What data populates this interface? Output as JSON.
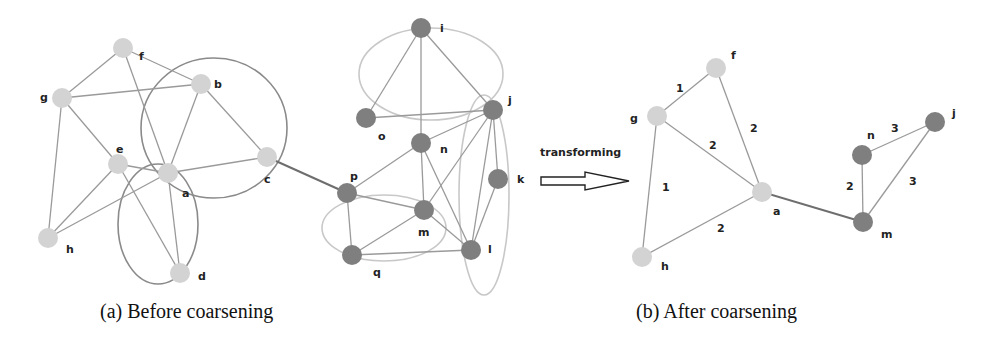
{
  "figure": {
    "arrow_label": "transforming",
    "caption_a": "(a)  Before coarsening",
    "caption_b": "(b) After coarsening"
  },
  "colors": {
    "light_node": "#d3d3d3",
    "dark_node": "#7f7f7f",
    "edge": "#9a9a9a",
    "ellipse_dark": "#8a8a8a",
    "ellipse_light": "#c8c8c8"
  },
  "graph_before": {
    "nodes": [
      {
        "id": "f",
        "x": 123,
        "y": 48,
        "shade": "light",
        "lx": 139,
        "ly": 60
      },
      {
        "id": "b",
        "x": 201,
        "y": 84,
        "shade": "light",
        "lx": 214,
        "ly": 88
      },
      {
        "id": "g",
        "x": 62,
        "y": 98,
        "shade": "light",
        "lx": 40,
        "ly": 101
      },
      {
        "id": "e",
        "x": 118,
        "y": 164,
        "shade": "light",
        "lx": 116,
        "ly": 153
      },
      {
        "id": "a",
        "x": 168,
        "y": 173,
        "shade": "light",
        "lx": 182,
        "ly": 197
      },
      {
        "id": "c",
        "x": 267,
        "y": 157,
        "shade": "light",
        "lx": 264,
        "ly": 183
      },
      {
        "id": "h",
        "x": 48,
        "y": 238,
        "shade": "light",
        "lx": 66,
        "ly": 253
      },
      {
        "id": "d",
        "x": 180,
        "y": 273,
        "shade": "light",
        "lx": 198,
        "ly": 280
      },
      {
        "id": "i",
        "x": 421,
        "y": 28,
        "shade": "dark",
        "lx": 440,
        "ly": 32
      },
      {
        "id": "o",
        "x": 366,
        "y": 118,
        "shade": "dark",
        "lx": 378,
        "ly": 140
      },
      {
        "id": "j",
        "x": 493,
        "y": 110,
        "shade": "dark",
        "lx": 508,
        "ly": 104
      },
      {
        "id": "n",
        "x": 421,
        "y": 143,
        "shade": "dark",
        "lx": 440,
        "ly": 153
      },
      {
        "id": "k",
        "x": 498,
        "y": 179,
        "shade": "dark",
        "lx": 517,
        "ly": 183
      },
      {
        "id": "p",
        "x": 347,
        "y": 193,
        "shade": "dark",
        "lx": 350,
        "ly": 180
      },
      {
        "id": "m",
        "x": 424,
        "y": 210,
        "shade": "dark",
        "lx": 418,
        "ly": 236
      },
      {
        "id": "q",
        "x": 352,
        "y": 255,
        "shade": "dark",
        "lx": 373,
        "ly": 276
      },
      {
        "id": "l",
        "x": 471,
        "y": 250,
        "shade": "dark",
        "lx": 488,
        "ly": 253
      }
    ],
    "edges": [
      [
        "f",
        "g"
      ],
      [
        "f",
        "b"
      ],
      [
        "f",
        "a"
      ],
      [
        "g",
        "b"
      ],
      [
        "g",
        "e"
      ],
      [
        "g",
        "h"
      ],
      [
        "b",
        "a"
      ],
      [
        "b",
        "c"
      ],
      [
        "e",
        "a"
      ],
      [
        "e",
        "h"
      ],
      [
        "e",
        "d"
      ],
      [
        "a",
        "h"
      ],
      [
        "a",
        "d"
      ],
      [
        "a",
        "c"
      ],
      [
        "c",
        "p"
      ],
      [
        "i",
        "o"
      ],
      [
        "i",
        "n"
      ],
      [
        "i",
        "j"
      ],
      [
        "o",
        "j"
      ],
      [
        "j",
        "n"
      ],
      [
        "j",
        "m"
      ],
      [
        "j",
        "l"
      ],
      [
        "j",
        "k"
      ],
      [
        "n",
        "p"
      ],
      [
        "n",
        "m"
      ],
      [
        "n",
        "l"
      ],
      [
        "k",
        "l"
      ],
      [
        "p",
        "m"
      ],
      [
        "p",
        "q"
      ],
      [
        "m",
        "q"
      ],
      [
        "m",
        "l"
      ],
      [
        "q",
        "l"
      ]
    ],
    "ellipses": [
      {
        "cx": 214,
        "cy": 128,
        "rx": 73,
        "ry": 70,
        "shade": "dark"
      },
      {
        "cx": 158,
        "cy": 224,
        "rx": 40,
        "ry": 60,
        "shade": "dark"
      },
      {
        "cx": 431,
        "cy": 74,
        "rx": 72,
        "ry": 46,
        "shade": "light"
      },
      {
        "cx": 384,
        "cy": 228,
        "rx": 62,
        "ry": 33,
        "shade": "light"
      },
      {
        "cx": 484,
        "cy": 195,
        "rx": 25,
        "ry": 100,
        "shade": "light"
      }
    ]
  },
  "graph_after": {
    "nodes": [
      {
        "id": "f",
        "x": 716,
        "y": 68,
        "shade": "light",
        "lx": 731,
        "ly": 59
      },
      {
        "id": "g",
        "x": 657,
        "y": 116,
        "shade": "light",
        "lx": 630,
        "ly": 122
      },
      {
        "id": "a",
        "x": 762,
        "y": 192,
        "shade": "light",
        "lx": 773,
        "ly": 215
      },
      {
        "id": "h",
        "x": 642,
        "y": 257,
        "shade": "light",
        "lx": 661,
        "ly": 270
      },
      {
        "id": "n",
        "x": 862,
        "y": 155,
        "shade": "dark",
        "lx": 867,
        "ly": 139
      },
      {
        "id": "j",
        "x": 935,
        "y": 122,
        "shade": "dark",
        "lx": 952,
        "ly": 117
      },
      {
        "id": "m",
        "x": 863,
        "y": 222,
        "shade": "dark",
        "lx": 881,
        "ly": 238
      }
    ],
    "edges": [
      {
        "from": "g",
        "to": "f",
        "weight": "1",
        "wx": 676,
        "wy": 92
      },
      {
        "from": "f",
        "to": "a",
        "weight": "2",
        "wx": 750,
        "wy": 132
      },
      {
        "from": "g",
        "to": "a",
        "weight": "2",
        "wx": 709,
        "wy": 149
      },
      {
        "from": "g",
        "to": "h",
        "weight": "1",
        "wx": 662,
        "wy": 191
      },
      {
        "from": "h",
        "to": "a",
        "weight": "2",
        "wx": 717,
        "wy": 232
      },
      {
        "from": "a",
        "to": "m",
        "weight": "",
        "wx": 0,
        "wy": 0,
        "strong": true
      },
      {
        "from": "n",
        "to": "j",
        "weight": "3",
        "wx": 891,
        "wy": 132
      },
      {
        "from": "n",
        "to": "m",
        "weight": "2",
        "wx": 846,
        "wy": 190
      },
      {
        "from": "j",
        "to": "m",
        "weight": "3",
        "wx": 909,
        "wy": 185
      }
    ]
  }
}
